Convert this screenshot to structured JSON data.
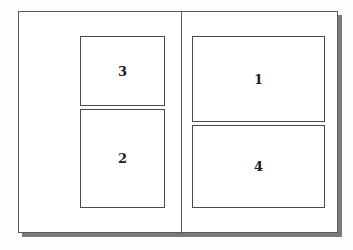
{
  "diagram": {
    "frame": {
      "name": "page-outline"
    },
    "divider": {
      "name": "column-divider"
    },
    "regions": [
      {
        "id": "region-1",
        "label": "1",
        "column": "right",
        "order": 1
      },
      {
        "id": "region-2",
        "label": "2",
        "column": "left",
        "order": 2
      },
      {
        "id": "region-3",
        "label": "3",
        "column": "left",
        "order": 3
      },
      {
        "id": "region-4",
        "label": "4",
        "column": "right",
        "order": 4
      }
    ]
  },
  "colors": {
    "page_background": "#ffffff",
    "outline": "#5c5c5c",
    "region_outline": "#4a4a4a",
    "label_text": "#1c1c1c",
    "shadow": "#575757"
  }
}
